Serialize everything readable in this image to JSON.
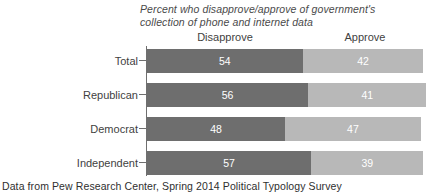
{
  "chart_data": {
    "type": "bar",
    "orientation": "horizontal",
    "stacked": true,
    "title_lines": [
      "Percent who disapprove/approve of government's",
      "collection of phone and internet data"
    ],
    "title": "Percent who disapprove/approve of government's collection of phone and internet data",
    "categories": [
      "Total",
      "Republican",
      "Democrat",
      "Independent"
    ],
    "series": [
      {
        "name": "Disapprove",
        "values": [
          54,
          56,
          48,
          57
        ],
        "color": "#6e6e6e"
      },
      {
        "name": "Approve",
        "values": [
          42,
          41,
          47,
          39
        ],
        "color": "#b8b8b8"
      }
    ],
    "column_headers": [
      "Disapprove",
      "Approve"
    ],
    "xlabel": "",
    "ylabel": "",
    "xlim": [
      0,
      100
    ],
    "grid": false,
    "legend": "column-headers-above-bars",
    "value_label_color": "#ffffff",
    "footer": "Data from Pew Research Center, Spring 2014 Political Typology Survey"
  },
  "colors": {
    "disapprove": "#6e6e6e",
    "approve": "#b8b8b8",
    "axis": "#6f6f6f",
    "text": "#3f3f3f",
    "background": "#ffffff"
  }
}
